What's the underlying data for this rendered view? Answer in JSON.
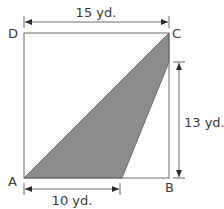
{
  "diagram": {
    "vertices": {
      "A": "A",
      "B": "B",
      "C": "C",
      "D": "D"
    },
    "dimensions": {
      "top": "15 yd.",
      "right": "13 yd.",
      "bottom": "10 yd."
    },
    "colors": {
      "outline": "#6b6b6b",
      "shade": "#8c8c8c",
      "text": "#3a3a3a"
    }
  }
}
